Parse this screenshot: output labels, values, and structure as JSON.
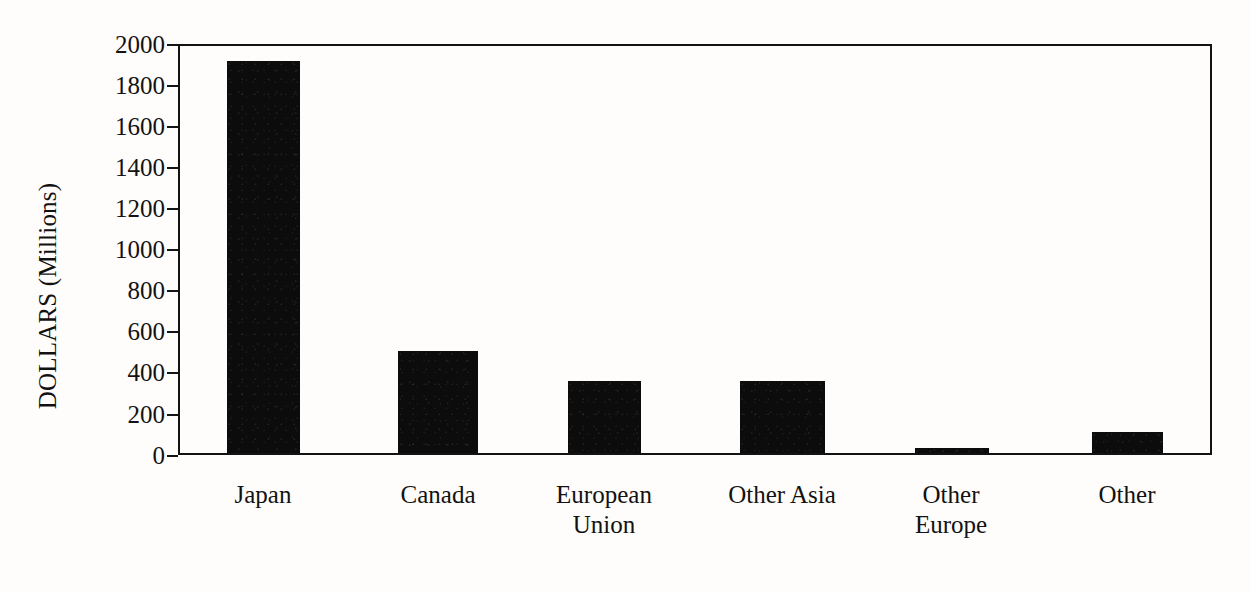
{
  "chart_data": {
    "type": "bar",
    "title": "",
    "subtitle": "",
    "xlabel": "",
    "ylabel": "DOLLARS (Millions)",
    "categories": [
      "Japan",
      "Canada",
      "European Union",
      "Other Asia",
      "Other Europe",
      "Other"
    ],
    "category_labels_wrapped": [
      "Japan",
      "Canada",
      "European\nUnion",
      "Other Asia",
      "Other\nEurope",
      "Other"
    ],
    "values": [
      1925,
      500,
      355,
      355,
      25,
      105
    ],
    "ylim": [
      0,
      2000
    ],
    "ytick_values": [
      2000,
      1800,
      1600,
      1400,
      1200,
      1000,
      800,
      600,
      400,
      200,
      0
    ],
    "ytick_labels": [
      "2000",
      "1800",
      "1600",
      "1400",
      "1200",
      "1000",
      "800",
      "600",
      "400",
      "200",
      "0"
    ],
    "grid": false,
    "legend": false,
    "legend_position": "none",
    "bar_color": "#0c0c0c",
    "axis_color": "#131313",
    "background_color": "#fffdfb"
  }
}
